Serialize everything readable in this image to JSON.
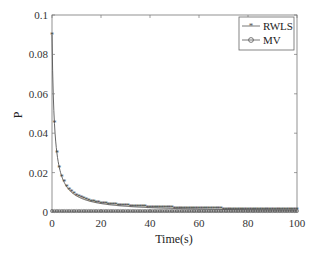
{
  "chart_data": {
    "type": "line",
    "title": "",
    "xlabel": "Time(s)",
    "ylabel": "P",
    "xlim": [
      0,
      100
    ],
    "ylim": [
      0,
      0.1
    ],
    "xticks": [
      0,
      20,
      40,
      60,
      80,
      100
    ],
    "xtick_labels": [
      "0",
      "20",
      "40",
      "60",
      "80",
      "100"
    ],
    "yticks": [
      0,
      0.02,
      0.04,
      0.06,
      0.08,
      0.1
    ],
    "ytick_labels": [
      "0",
      "0.02",
      "0.04",
      "0.06",
      "0.08",
      "0.1"
    ],
    "grid": false,
    "legend_position": "upper right",
    "series": [
      {
        "name": "RWLS",
        "marker": "*",
        "color": "#555555",
        "x": [
          0,
          1,
          2,
          3,
          4,
          5,
          6,
          7,
          8,
          9,
          10,
          12,
          14,
          16,
          18,
          20,
          25,
          30,
          35,
          40,
          50,
          60,
          70,
          80,
          90,
          100
        ],
        "values": [
          0.09,
          0.045,
          0.03,
          0.0225,
          0.018,
          0.015,
          0.0129,
          0.0113,
          0.01,
          0.009,
          0.0082,
          0.0069,
          0.006,
          0.0053,
          0.0047,
          0.0043,
          0.0035,
          0.0029,
          0.0025,
          0.0022,
          0.0018,
          0.0015,
          0.0013,
          0.0011,
          0.001,
          0.0009
        ]
      },
      {
        "name": "MV",
        "marker": "o",
        "color": "#555555",
        "x": [
          0,
          10,
          20,
          30,
          40,
          50,
          60,
          70,
          80,
          90,
          100
        ],
        "values": [
          0.0005,
          0.0005,
          0.0005,
          0.0005,
          0.0005,
          0.0005,
          0.0005,
          0.0005,
          0.0005,
          0.0005,
          0.0005
        ]
      }
    ]
  }
}
